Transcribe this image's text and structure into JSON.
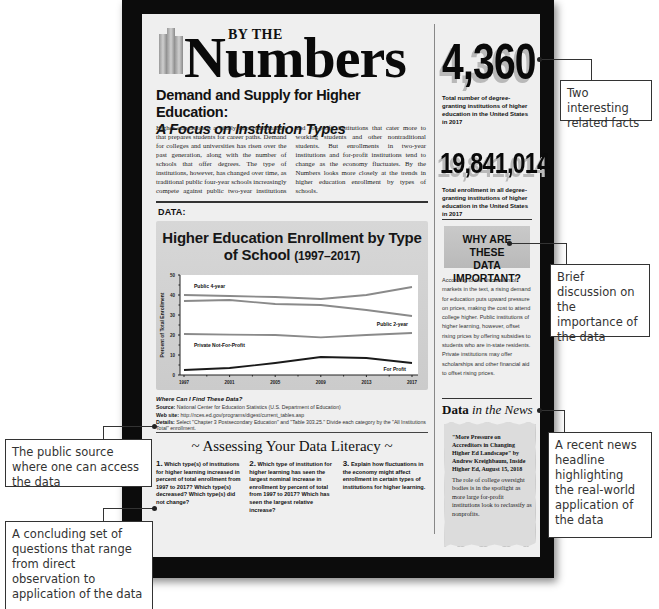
{
  "header": {
    "by_the": "BY THE",
    "numbers": "Numbers",
    "headline": "Demand and Supply for Higher Education:",
    "subheadline": "A Focus on Institution Types"
  },
  "intro_text": "Higher education is a vitally important market that prepares students for career paths. Demand for colleges and universities has risen over the past generation, along with the number of schools that offer degrees. The type of institutions, however, has changed over time, as traditional public four-year schools increasingly compete against public two-year institutions and for-profit institutions that cater more to working students and other nontraditional students. But enrollments in two-year institutions and for-profit institutions tend to change as the economy fluctuates. By the Numbers looks more closely at the trends in higher education enrollment by types of schools.",
  "data_label": "DATA:",
  "chart_data": {
    "type": "line",
    "title": "Higher Education Enrollment by Type of School",
    "title_years": "(1997–2017)",
    "xlabel": "",
    "ylabel": "Percent of Total Enrollment",
    "x": [
      1997,
      2001,
      2005,
      2009,
      2013,
      2017
    ],
    "x_tick_labels": [
      "1997",
      "2001",
      "2005",
      "2009",
      "2013",
      "2017"
    ],
    "y_ticks": [
      0,
      10,
      20,
      30,
      40,
      50
    ],
    "ylim": [
      0,
      50
    ],
    "grid": false,
    "series": [
      {
        "name": "Public 4-year",
        "values": [
          40,
          39.5,
          39,
          38,
          40,
          44
        ],
        "color": "#8a8a8a"
      },
      {
        "name": "Public 2-year",
        "values": [
          37,
          37.5,
          35.5,
          35,
          32.5,
          29.5
        ],
        "color": "#8a8a8a"
      },
      {
        "name": "Private Not-For-Profit",
        "values": [
          20.5,
          20.2,
          20,
          18.8,
          20,
          21
        ],
        "color": "#8a8a8a"
      },
      {
        "name": "For Profit",
        "values": [
          2.5,
          3.5,
          6,
          9,
          8.5,
          6
        ],
        "color": "#1a1a1a"
      }
    ]
  },
  "source": {
    "question": "Where Can I Find These Data?",
    "source_label": "Source:",
    "source_text": "National Center for Education Statistics (U.S. Department of Education)",
    "web_label": "Web site:",
    "web_text": "http://nces.ed.gov/programs/digest/current_tables.asp",
    "details_label": "Details:",
    "details_text": "Select \"Chapter 3 Postsecondary Education\" and \"Table 303.25.\" Divide each category by the \"All Institutions Total\" enrollment."
  },
  "assessing": {
    "title": "~ Assessing Your Data Literacy ~",
    "questions": [
      {
        "num": "1.",
        "text": "Which type(s) of institutions for higher learning increased in percent of total enrollment from 1997 to 2017? Which type(s) decreased? Which type(s) did not change?"
      },
      {
        "num": "2.",
        "text": "Which type of institution for higher learning has seen the largest nominal increase in enrollment by percent of total from 1997 to 2017? Which has seen the largest relative increase?"
      },
      {
        "num": "3.",
        "text": "Explain how fluctuations in the economy might affect enrollment in certain types of institutions for higher learning."
      }
    ]
  },
  "facts": [
    {
      "value": "4,360",
      "caption": "Total number of degree-granting institutions of higher education in the United States in 2017"
    },
    {
      "value": "19,841,014",
      "caption": "Total enrollment in all degree-granting institutions of higher education in the United States in 2017"
    }
  ],
  "why": {
    "title_line1": "WHY ARE THESE",
    "title_line2": "DATA IMPORTANT?",
    "text": "According to the discussion of markets in the text, a rising demand for education puts upward pressure on prices, making the cost to attend college higher. Public institutions of higher learning, however, offset rising prices by offering subsidies to students who are in-state residents. Private institutions may offer scholarships and other financial aid to offset rising prices."
  },
  "news": {
    "title_bold": "Data ",
    "title_italic": "in the News",
    "headline": "\"More Pressure on Accreditors in Changing Higher Ed Landscape\" by Andrew Kreighbaum, Inside Higher Ed, August 15, 2018",
    "body": "The role of college oversight bodies is in the spotlight as more large for-profit institutions look to reclassify as nonprofits."
  },
  "callouts": {
    "facts": "Two interesting related facts",
    "why": "Brief discussion on the importance of the data",
    "news": "A recent news headline highlighting the real-world application of the data",
    "source": "The public source where one can access the data",
    "questions": "A concluding set of questions that range from direct observation to application of the data"
  }
}
